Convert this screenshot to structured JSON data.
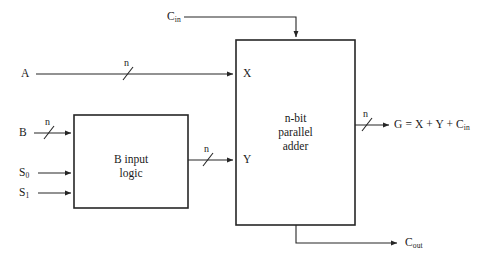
{
  "diagram": {
    "stroke_color": "#262626",
    "text_color": "#1a1a1a",
    "background": "#ffffff",
    "blocks": [
      {
        "id": "b-input-logic",
        "lines": [
          "B input",
          "logic"
        ],
        "x": 74,
        "y": 115,
        "w": 114,
        "h": 93
      },
      {
        "id": "n-bit-parallel-adder",
        "lines": [
          "n-bit",
          "parallel",
          "adder"
        ],
        "x": 236,
        "y": 40,
        "w": 119,
        "h": 185
      }
    ],
    "inputs": {
      "cin_label": "C",
      "cin_sub": "in",
      "a_label": "A",
      "b_label": "B",
      "s0_label": "S",
      "s0_sub": "0",
      "s1_label": "S",
      "s1_sub": "1"
    },
    "ports": {
      "x_port": "X",
      "y_port": "Y"
    },
    "outputs": {
      "g_label": "G = X + Y + C",
      "g_sub": "in",
      "cout_label": "C",
      "cout_sub": "out"
    },
    "bus_width_tags": {
      "a_bus": "n",
      "b_bus": "n",
      "b_logic_out_bus": "n",
      "g_bus": "n"
    }
  }
}
